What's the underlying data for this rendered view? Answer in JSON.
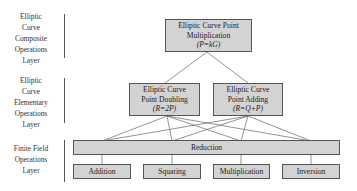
{
  "layers": [
    {
      "label_lines": [
        "Elliptic",
        "Curve",
        "Composite",
        "Operations",
        "Layer"
      ]
    },
    {
      "label_lines": [
        "Elliptic",
        "Curve",
        "Elementary",
        "Operations",
        "Layer"
      ]
    },
    {
      "label_lines": [
        "Finite Field",
        "Operations",
        "Layer"
      ]
    }
  ],
  "nodes": {
    "point_multiplication": {
      "title_lines": [
        "Elliptic Curve Point",
        "Multiplication"
      ],
      "formula": "(P=kG)"
    },
    "point_doubling": {
      "title_lines": [
        "Elliptic Curve",
        "Point Doubling"
      ],
      "formula": "(R=2P)"
    },
    "point_adding": {
      "title_lines": [
        "Elliptic Curve",
        "Point Adding"
      ],
      "formula": "(R=Q+P)"
    },
    "reduction": {
      "title": "Reduction"
    },
    "addition": {
      "title": "Addition"
    },
    "squaring": {
      "title": "Squaring"
    },
    "multiplication": {
      "title": "Multiplication"
    },
    "inversion": {
      "title": "Inversion"
    }
  },
  "colors": {
    "box_fill": "#d3d3d3",
    "box_border": "#555555",
    "line": "#666666"
  }
}
